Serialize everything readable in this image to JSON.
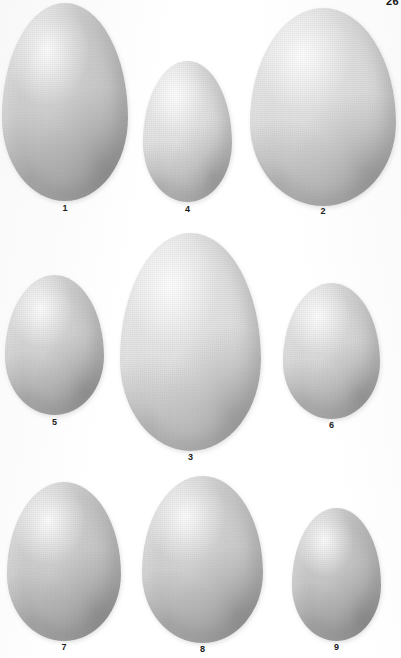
{
  "plate": {
    "kind": "egg-plate",
    "page_number": "26",
    "background_color": "#ffffff",
    "width": 401,
    "height": 658,
    "label_color": "#1b1b1b",
    "rows": 3
  },
  "eggs": [
    {
      "label": "1",
      "x": 2,
      "y": 3,
      "w": 126,
      "h": 198,
      "label_y": 203,
      "hi": "#d8d8d8",
      "mid": "#c6c6c6",
      "lo": "#a9a9a9",
      "edge": "#8b8b8b",
      "row": 1
    },
    {
      "label": "4",
      "x": 143,
      "y": 61,
      "w": 89,
      "h": 141,
      "label_y": 204,
      "hi": "#eaeaea",
      "mid": "#dcdcdc",
      "lo": "#c2c2c2",
      "edge": "#a2a2a2",
      "row": 1
    },
    {
      "label": "2",
      "x": 250,
      "y": 8,
      "w": 146,
      "h": 198,
      "label_y": 206,
      "hi": "#e8e8e8",
      "mid": "#d9d9d9",
      "lo": "#bdbdbd",
      "edge": "#9a9a9a",
      "row": 1
    },
    {
      "label": "5",
      "x": 5,
      "y": 275,
      "w": 99,
      "h": 140,
      "label_y": 417,
      "hi": "#dcdcdc",
      "mid": "#cacaca",
      "lo": "#aeaeae",
      "edge": "#8f8f8f",
      "row": 2
    },
    {
      "label": "3",
      "x": 120,
      "y": 233,
      "w": 141,
      "h": 218,
      "label_y": 452,
      "hi": "#ebebeb",
      "mid": "#dddddd",
      "lo": "#c4c4c4",
      "edge": "#a4a4a4",
      "row": 2
    },
    {
      "label": "6",
      "x": 283,
      "y": 283,
      "w": 97,
      "h": 136,
      "label_y": 420,
      "hi": "#e2e2e2",
      "mid": "#d2d2d2",
      "lo": "#b6b6b6",
      "edge": "#969696",
      "row": 2
    },
    {
      "label": "7",
      "x": 7,
      "y": 482,
      "w": 114,
      "h": 159,
      "label_y": 642,
      "hi": "#d6d6d6",
      "mid": "#c4c4c4",
      "lo": "#a8a8a8",
      "edge": "#888888",
      "row": 3
    },
    {
      "label": "8",
      "x": 142,
      "y": 476,
      "w": 121,
      "h": 167,
      "label_y": 644,
      "hi": "#dadada",
      "mid": "#c9c9c9",
      "lo": "#adadad",
      "edge": "#8d8d8d",
      "row": 3
    },
    {
      "label": "9",
      "x": 292,
      "y": 508,
      "w": 89,
      "h": 133,
      "label_y": 642,
      "hi": "#cfcfcf",
      "mid": "#bebebe",
      "lo": "#a3a3a3",
      "edge": "#858585",
      "row": 3
    }
  ]
}
